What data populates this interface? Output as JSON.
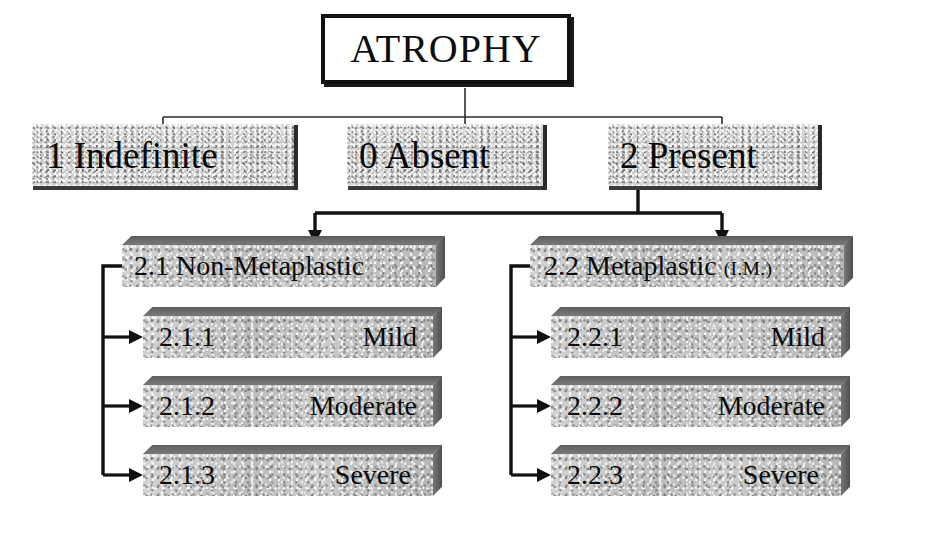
{
  "diagram": {
    "title": "ATROPHY",
    "root": {
      "label": "ATROPHY"
    },
    "level1": [
      {
        "code": "1",
        "label": "1 Indefinite"
      },
      {
        "code": "0",
        "label": "0 Absent"
      },
      {
        "code": "2",
        "label": "2 Present"
      }
    ],
    "level2": [
      {
        "code": "2.1",
        "label": "2.1  Non-Metaplastic",
        "suffix": "",
        "children": [
          {
            "code": "2.1.1",
            "grade": "Mild"
          },
          {
            "code": "2.1.2",
            "grade": "Moderate"
          },
          {
            "code": "2.1.3",
            "grade": "Severe"
          }
        ]
      },
      {
        "code": "2.2",
        "label": "2.2  Metaplastic ",
        "suffix": "(I.M.)",
        "children": [
          {
            "code": "2.2.1",
            "grade": "Mild"
          },
          {
            "code": "2.2.2",
            "grade": "Moderate"
          },
          {
            "code": "2.2.3",
            "grade": "Severe"
          }
        ]
      }
    ],
    "colors": {
      "background": "#ffffff",
      "box_fill": "#c7c7c7",
      "box_shadow": "#5e5e5e",
      "line": "#111111",
      "text": "#0b0b0b"
    }
  }
}
